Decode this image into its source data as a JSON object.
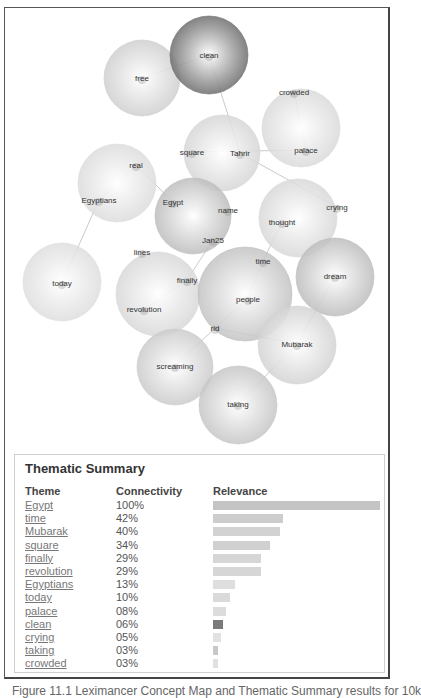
{
  "concept_map": {
    "circles": [
      {
        "id": "free",
        "cx": 142,
        "cy": 78,
        "r": 38,
        "shade": "#cfcfcf"
      },
      {
        "id": "clean",
        "cx": 209,
        "cy": 55,
        "r": 39,
        "shade": "#6e6e6e"
      },
      {
        "id": "crowded-palace",
        "cx": 301,
        "cy": 128,
        "r": 39,
        "shade": "#dadada"
      },
      {
        "id": "tahrir-square",
        "cx": 222,
        "cy": 153,
        "r": 38,
        "shade": "#d6d6d6"
      },
      {
        "id": "real-egyptians",
        "cx": 117,
        "cy": 183,
        "r": 39,
        "shade": "#dcdcdc"
      },
      {
        "id": "egypt",
        "cx": 193,
        "cy": 216,
        "r": 38,
        "shade": "#bdbdbd"
      },
      {
        "id": "thought-crying",
        "cx": 298,
        "cy": 218,
        "r": 39,
        "shade": "#d8d8d8"
      },
      {
        "id": "today",
        "cx": 62,
        "cy": 282,
        "r": 39,
        "shade": "#dedede"
      },
      {
        "id": "revolution",
        "cx": 158,
        "cy": 294,
        "r": 42,
        "shade": "#d8d8d8"
      },
      {
        "id": "people",
        "cx": 245,
        "cy": 294,
        "r": 47,
        "shade": "#c3c3c3"
      },
      {
        "id": "dream",
        "cx": 335,
        "cy": 277,
        "r": 39,
        "shade": "#bdbdbd"
      },
      {
        "id": "mubarak",
        "cx": 297,
        "cy": 345,
        "r": 39,
        "shade": "#d3d3d3"
      },
      {
        "id": "screaming",
        "cx": 175,
        "cy": 367,
        "r": 38,
        "shade": "#cbcbcb"
      },
      {
        "id": "taking",
        "cx": 238,
        "cy": 405,
        "r": 39,
        "shade": "#c6c6c6"
      }
    ],
    "labels": [
      {
        "text": "clean",
        "x": 209,
        "y": 55
      },
      {
        "text": "free",
        "x": 142,
        "y": 78
      },
      {
        "text": "crowded",
        "x": 294,
        "y": 92
      },
      {
        "text": "square",
        "x": 192,
        "y": 152
      },
      {
        "text": "Tahrir",
        "x": 240,
        "y": 153
      },
      {
        "text": "palace",
        "x": 306,
        "y": 150
      },
      {
        "text": "real",
        "x": 136,
        "y": 165
      },
      {
        "text": "Egyptians",
        "x": 99,
        "y": 200
      },
      {
        "text": "Egypt",
        "x": 173,
        "y": 202
      },
      {
        "text": "name",
        "x": 228,
        "y": 210
      },
      {
        "text": "crying",
        "x": 337,
        "y": 207
      },
      {
        "text": "thought",
        "x": 282,
        "y": 222
      },
      {
        "text": "Jan25",
        "x": 213,
        "y": 240
      },
      {
        "text": "lines",
        "x": 142,
        "y": 252
      },
      {
        "text": "time",
        "x": 263,
        "y": 261
      },
      {
        "text": "today",
        "x": 62,
        "y": 283
      },
      {
        "text": "finally",
        "x": 187,
        "y": 280
      },
      {
        "text": "dream",
        "x": 335,
        "y": 276
      },
      {
        "text": "revolution",
        "x": 144,
        "y": 309
      },
      {
        "text": "people",
        "x": 248,
        "y": 299
      },
      {
        "text": "rid",
        "x": 215,
        "y": 328
      },
      {
        "text": "Mubarak",
        "x": 297,
        "y": 344
      },
      {
        "text": "screaming",
        "x": 175,
        "y": 366
      },
      {
        "text": "taking",
        "x": 238,
        "y": 404
      }
    ],
    "links": [
      [
        142,
        78,
        209,
        55
      ],
      [
        209,
        55,
        240,
        153
      ],
      [
        192,
        152,
        306,
        150
      ],
      [
        294,
        92,
        306,
        150
      ],
      [
        240,
        153,
        337,
        207
      ],
      [
        136,
        165,
        99,
        200
      ],
      [
        136,
        165,
        173,
        202
      ],
      [
        173,
        202,
        213,
        240
      ],
      [
        99,
        200,
        62,
        283
      ],
      [
        282,
        222,
        263,
        261
      ],
      [
        263,
        261,
        248,
        299
      ],
      [
        187,
        280,
        144,
        309
      ],
      [
        187,
        280,
        213,
        240
      ],
      [
        215,
        328,
        297,
        344
      ],
      [
        335,
        276,
        297,
        344
      ],
      [
        297,
        344,
        238,
        404
      ],
      [
        175,
        366,
        215,
        328
      ],
      [
        248,
        299,
        215,
        328
      ]
    ]
  },
  "summary": {
    "title": "Thematic Summary",
    "columns": {
      "theme": "Theme",
      "connectivity": "Connectivity",
      "relevance": "Relevance"
    },
    "rows": [
      {
        "theme": "Egypt",
        "connectivity": "100%",
        "relevance": 100,
        "color": "#c4c4c4"
      },
      {
        "theme": "time",
        "connectivity": "42%",
        "relevance": 42,
        "color": "#cdcdcd"
      },
      {
        "theme": "Mubarak",
        "connectivity": "40%",
        "relevance": 40,
        "color": "#d2d2d2"
      },
      {
        "theme": "square",
        "connectivity": "34%",
        "relevance": 34,
        "color": "#d0d0d0"
      },
      {
        "theme": "finally",
        "connectivity": "29%",
        "relevance": 29,
        "color": "#d6d6d6"
      },
      {
        "theme": "revolution",
        "connectivity": "29%",
        "relevance": 29,
        "color": "#d6d6d6"
      },
      {
        "theme": "Egyptians",
        "connectivity": "13%",
        "relevance": 13,
        "color": "#dedede"
      },
      {
        "theme": "today",
        "connectivity": "10%",
        "relevance": 10,
        "color": "#dadada"
      },
      {
        "theme": "palace",
        "connectivity": "08%",
        "relevance": 8,
        "color": "#dcdcdc"
      },
      {
        "theme": "clean",
        "connectivity": "06%",
        "relevance": 6,
        "color": "#7a7a7a"
      },
      {
        "theme": "crying",
        "connectivity": "05%",
        "relevance": 5,
        "color": "#e2e2e2"
      },
      {
        "theme": "taking",
        "connectivity": "03%",
        "relevance": 3,
        "color": "#c8c8c8"
      },
      {
        "theme": "crowded",
        "connectivity": "03%",
        "relevance": 3,
        "color": "#e0e0e0"
      }
    ],
    "bar_max_width": 167
  },
  "caption": "Figure 11.1 Leximancer Concept Map and Thematic Summary results for 10k"
}
